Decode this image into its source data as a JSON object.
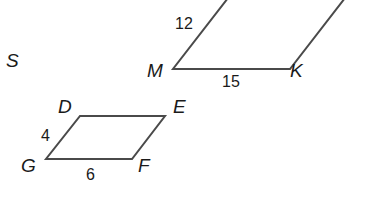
{
  "figure_label": "S",
  "large_parallelogram": {
    "vertices": {
      "top_left": "J",
      "bottom_left": "M",
      "bottom_right": "K"
    },
    "side_labels": {
      "left": "12",
      "bottom": "15"
    }
  },
  "small_parallelogram": {
    "vertices": {
      "top_left": "D",
      "top_right": "E",
      "bottom_left": "G",
      "bottom_right": "F"
    },
    "side_labels": {
      "left": "4",
      "bottom": "6"
    }
  },
  "colors": {
    "stroke": "#4a4a4a",
    "text": "#1a1a1a",
    "background": "#ffffff"
  }
}
